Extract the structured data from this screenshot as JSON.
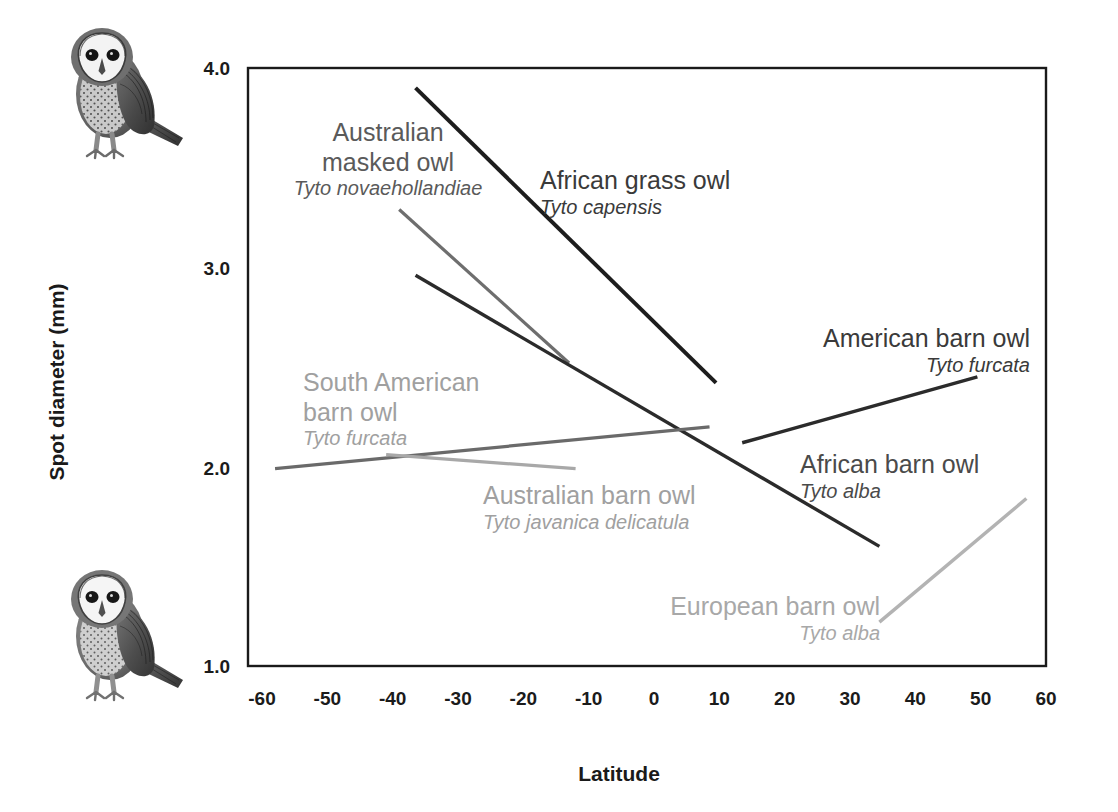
{
  "chart_data": {
    "type": "line",
    "title": "",
    "xlabel": "Latitude",
    "ylabel": "Spot diameter (mm)",
    "xlim": [
      -65,
      65
    ],
    "ylim": [
      1.0,
      4.0
    ],
    "xticks": [
      "-60",
      "-50",
      "-40",
      "-30",
      "-20",
      "-10",
      "0",
      "10",
      "20",
      "30",
      "40",
      "50",
      "60"
    ],
    "xtick_values": [
      -60,
      -50,
      -40,
      -30,
      -20,
      -10,
      0,
      10,
      20,
      30,
      40,
      50,
      60
    ],
    "yticks": [
      "4.0",
      "3.0",
      "2.0",
      "1.0"
    ],
    "ytick_values": [
      4.0,
      3.0,
      2.0,
      1.0
    ],
    "grid": false,
    "legend": "inline-annotations",
    "series": [
      {
        "name": "African grass owl",
        "scientific_name": "Tyto capensis",
        "color": "#1d1d1d",
        "width": 4.0,
        "x": [
          -36.5,
          9.5
        ],
        "y": [
          3.9,
          2.42
        ]
      },
      {
        "name": "Australian masked owl",
        "scientific_name": "Tyto novaehollandiae",
        "color": "#6e6e6e",
        "width": 3.2,
        "x": [
          -39.0,
          -13.0
        ],
        "y": [
          3.29,
          2.52
        ]
      },
      {
        "name": "African barn owl",
        "scientific_name": "Tyto alba",
        "color": "#2b2b2b",
        "width": 3.4,
        "x": [
          -36.5,
          34.5
        ],
        "y": [
          2.96,
          1.6
        ]
      },
      {
        "name": "South American barn owl",
        "scientific_name": "Tyto furcata",
        "color": "#6a6a6a",
        "width": 3.2,
        "x": [
          -58.0,
          8.5
        ],
        "y": [
          1.99,
          2.2
        ]
      },
      {
        "name": "Australian barn owl",
        "scientific_name": "Tyto javanica delicatula",
        "color": "#a8a8a8",
        "width": 3.2,
        "x": [
          -41.0,
          -12.0
        ],
        "y": [
          2.06,
          1.99
        ]
      },
      {
        "name": "American barn owl",
        "scientific_name": "Tyto furcata",
        "color": "#2b2b2b",
        "width": 3.4,
        "x": [
          13.5,
          49.5
        ],
        "y": [
          2.12,
          2.45
        ]
      },
      {
        "name": "European barn owl",
        "scientific_name": "Tyto alba",
        "color": "#b3b3b3",
        "width": 3.4,
        "x": [
          34.5,
          57.0
        ],
        "y": [
          1.22,
          1.84
        ]
      }
    ],
    "annotations": [
      {
        "name": "Australian masked owl",
        "scientific_name": "Tyto novaehollandiae",
        "color": "#5a5a5a",
        "x_px": 388,
        "y_px": 118,
        "align": "center"
      },
      {
        "name": "African grass owl",
        "scientific_name": "Tyto capensis",
        "color": "#3a3a3a",
        "x_px": 540,
        "y_px": 166,
        "align": "left"
      },
      {
        "name": "American barn owl",
        "scientific_name": "Tyto furcata",
        "color": "#3a3a3a",
        "x_px": 1030,
        "y_px": 324,
        "align": "right"
      },
      {
        "name": "South American barn owl",
        "scientific_name": "Tyto furcata",
        "color": "#a0a0a0",
        "x_px": 303,
        "y_px": 368,
        "align": "left"
      },
      {
        "name": "African barn owl",
        "scientific_name": "Tyto alba",
        "color": "#4a4a4a",
        "x_px": 800,
        "y_px": 450,
        "align": "left"
      },
      {
        "name": "Australian barn owl",
        "scientific_name": "Tyto javanica delicatula",
        "color": "#a0a0a0",
        "x_px": 483,
        "y_px": 481,
        "align": "left"
      },
      {
        "name": "European barn owl",
        "scientific_name": "Tyto alba",
        "color": "#a8a8a8",
        "x_px": 880,
        "y_px": 592,
        "align": "right"
      }
    ]
  },
  "plot": {
    "frame_color": "#1a1a1a",
    "background": "#ffffff"
  },
  "illustrations": [
    {
      "name": "barn-owl-top",
      "caption": "barn owl illustration"
    },
    {
      "name": "barn-owl-bottom",
      "caption": "barn owl illustration"
    }
  ]
}
